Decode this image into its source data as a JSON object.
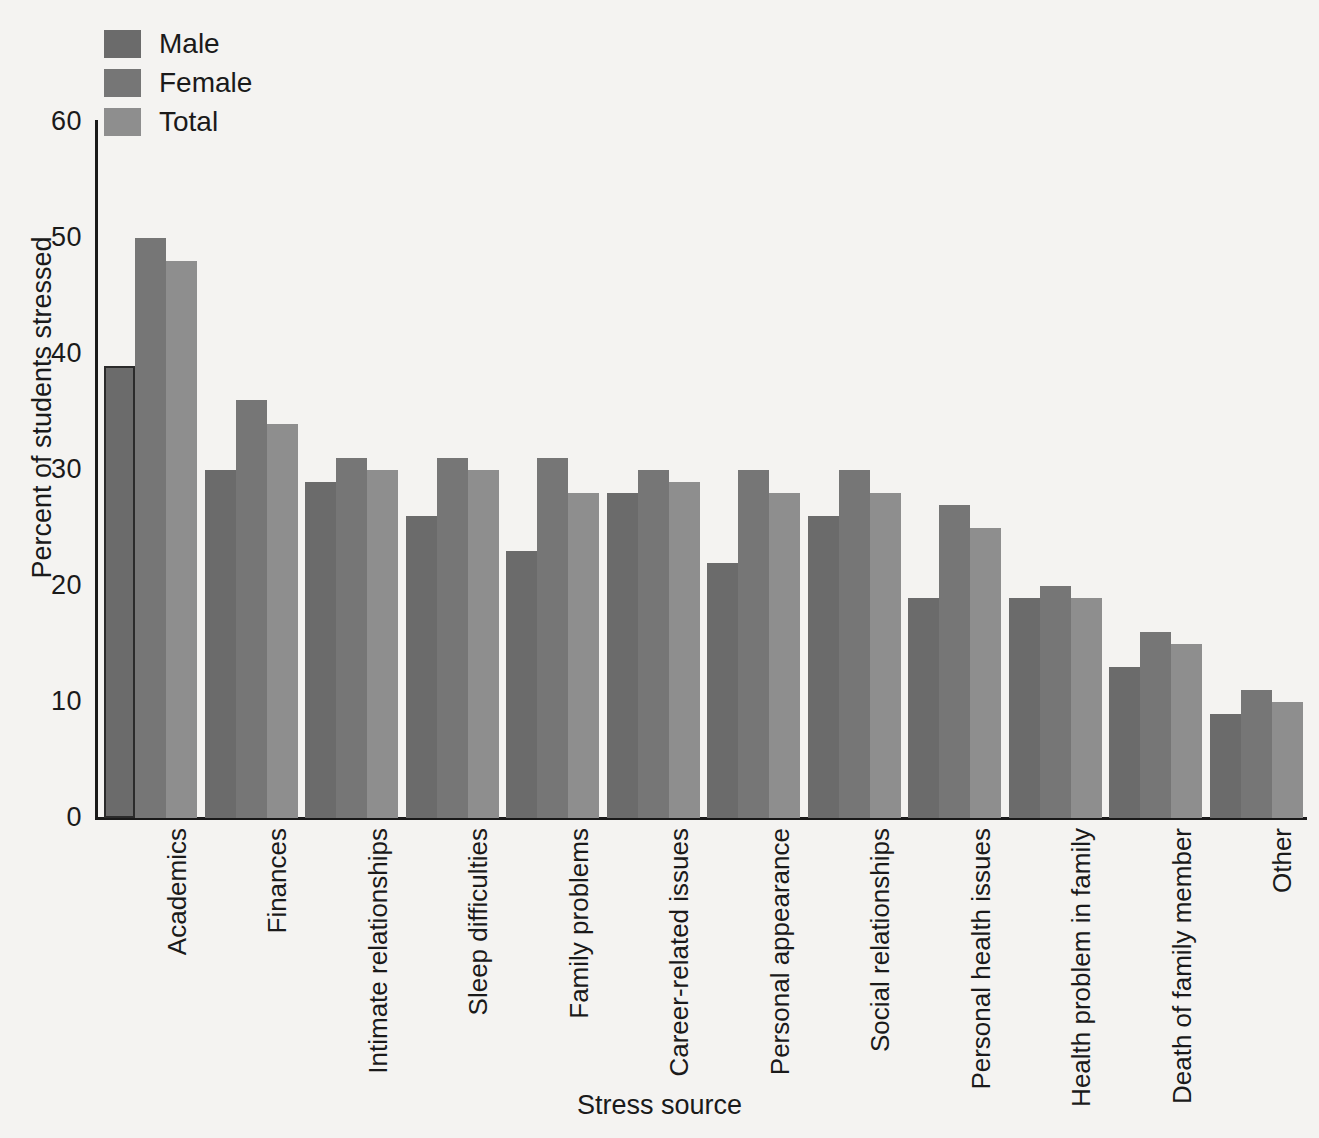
{
  "chart_data": {
    "type": "bar",
    "title": "",
    "xlabel": "Stress source",
    "ylabel": "Percent of students stressed",
    "ylim": [
      0,
      60
    ],
    "yticks": [
      0,
      10,
      20,
      30,
      40,
      50,
      60
    ],
    "grid": false,
    "legend_position": "top-left",
    "categories": [
      "Academics",
      "Finances",
      "Intimate relationships",
      "Sleep difficulties",
      "Family problems",
      "Career-related issues",
      "Personal appearance",
      "Social relationships",
      "Personal health issues",
      "Health problem in family",
      "Death of family member",
      "Other"
    ],
    "series": [
      {
        "name": "Male",
        "color": "#6b6b6b",
        "values": [
          39,
          30,
          29,
          26,
          23,
          28,
          22,
          26,
          19,
          19,
          13,
          9
        ]
      },
      {
        "name": "Female",
        "color": "#767676",
        "values": [
          50,
          36,
          31,
          31,
          31,
          30,
          30,
          30,
          27,
          20,
          16,
          11
        ]
      },
      {
        "name": "Total",
        "color": "#8e8e8e",
        "values": [
          48,
          34,
          30,
          30,
          28,
          29,
          28,
          28,
          25,
          19,
          15,
          10
        ]
      }
    ]
  },
  "legend": {
    "items": [
      {
        "label": "Male",
        "color": "#6b6b6b"
      },
      {
        "label": "Female",
        "color": "#767676"
      },
      {
        "label": "Total",
        "color": "#8e8e8e"
      }
    ]
  },
  "axes": {
    "y_title": "Percent of students stressed",
    "x_title": "Stress source",
    "y_tick_labels": [
      "60",
      "50",
      "40",
      "30",
      "20",
      "10",
      "0"
    ]
  },
  "colors": {
    "background": "#f4f3f1",
    "axis": "#1a1a1a",
    "text": "#1a1a1a",
    "male": "#6b6b6b",
    "female": "#767676",
    "total": "#8e8e8e",
    "male_outline": "#2b2b2b"
  }
}
